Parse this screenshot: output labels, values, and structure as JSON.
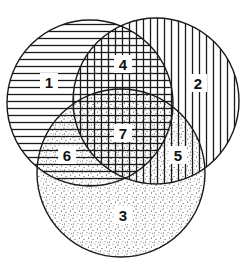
{
  "diagram": {
    "type": "venn",
    "sets": 3,
    "colors": {
      "background": "#ffffff",
      "stroke": "#1a1a1a",
      "pattern": "#1a1a1a"
    },
    "circles": [
      {
        "id": "A",
        "pattern": "horizontal-lines",
        "cx": 90,
        "cy": 103,
        "r": 83
      },
      {
        "id": "B",
        "pattern": "vertical-lines",
        "cx": 156,
        "cy": 101,
        "r": 83
      },
      {
        "id": "C",
        "pattern": "stipple-dots",
        "cx": 121,
        "cy": 173,
        "r": 84
      }
    ],
    "regions": [
      {
        "label": "1",
        "sets": [
          "A"
        ],
        "x": 49,
        "y": 82
      },
      {
        "label": "2",
        "sets": [
          "B"
        ],
        "x": 198,
        "y": 83
      },
      {
        "label": "3",
        "sets": [
          "C"
        ],
        "x": 123,
        "y": 215
      },
      {
        "label": "4",
        "sets": [
          "A",
          "B"
        ],
        "x": 123,
        "y": 64
      },
      {
        "label": "5",
        "sets": [
          "B",
          "C"
        ],
        "x": 178,
        "y": 155
      },
      {
        "label": "6",
        "sets": [
          "A",
          "C"
        ],
        "x": 67,
        "y": 155
      },
      {
        "label": "7",
        "sets": [
          "A",
          "B",
          "C"
        ],
        "x": 123,
        "y": 133
      }
    ]
  }
}
